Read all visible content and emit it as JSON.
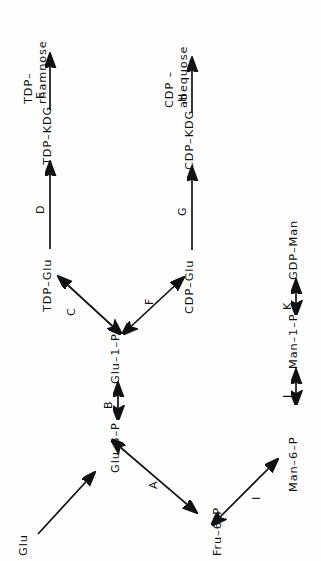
{
  "diagram": {
    "orientation": "rotated-90-ccw",
    "background_color": "#fefefe",
    "stroke_color": "#111111",
    "nodes": [
      {
        "id": "glu",
        "label": "Glu"
      },
      {
        "id": "glu6p",
        "label": "Glu–6–P"
      },
      {
        "id": "glu1p",
        "label": "Glu–1–P"
      },
      {
        "id": "tdpglu",
        "label": "TDP–Glu"
      },
      {
        "id": "tdpkdg",
        "label": "TDP–KDG"
      },
      {
        "id": "tdprham",
        "label": "TDP–",
        "label2": "rhamnose"
      },
      {
        "id": "cdpglu",
        "label": "CDP–Glu"
      },
      {
        "id": "cdpkdg",
        "label": "CDP–KDG"
      },
      {
        "id": "cdpabe",
        "label": "CDP –",
        "label2": "abequose"
      },
      {
        "id": "fru6p",
        "label": "Fru–6–P"
      },
      {
        "id": "man6p",
        "label": "Man–6–P"
      },
      {
        "id": "man1p",
        "label": "Man–1–P"
      },
      {
        "id": "gdpman",
        "label": "GDP–Man"
      }
    ],
    "edges": [
      {
        "id": "e-glu-glu6p",
        "from": "glu",
        "to": "glu6p",
        "label": "",
        "double": false
      },
      {
        "id": "e-glu6p-glu1p",
        "from": "glu6p",
        "to": "glu1p",
        "label": "B",
        "double": true
      },
      {
        "id": "e-glu6p-fru6p",
        "from": "glu6p",
        "to": "fru6p",
        "label": "A",
        "double": true
      },
      {
        "id": "e-glu1p-tdpglu",
        "from": "glu1p",
        "to": "tdpglu",
        "label": "C",
        "double": true
      },
      {
        "id": "e-glu1p-cdpglu",
        "from": "glu1p",
        "to": "cdpglu",
        "label": "F",
        "double": true
      },
      {
        "id": "e-tdpglu-tdpkdg",
        "from": "tdpglu",
        "to": "tdpkdg",
        "label": "D",
        "double": false
      },
      {
        "id": "e-tdpkdg-tdprham",
        "from": "tdpkdg",
        "to": "tdprham",
        "label": "E",
        "double": false
      },
      {
        "id": "e-cdpglu-cdpkdg",
        "from": "cdpglu",
        "to": "cdpkdg",
        "label": "G",
        "double": false
      },
      {
        "id": "e-cdpkdg-cdpabe",
        "from": "cdpkdg",
        "to": "cdpabe",
        "label": "H",
        "double": false
      },
      {
        "id": "e-fru6p-man6p",
        "from": "fru6p",
        "to": "man6p",
        "label": "I",
        "double": true
      },
      {
        "id": "e-man6p-man1p",
        "from": "man6p",
        "to": "man1p",
        "label": "J",
        "double": true
      },
      {
        "id": "e-man1p-gdpman",
        "from": "man1p",
        "to": "gdpman",
        "label": "K",
        "double": true
      }
    ]
  }
}
